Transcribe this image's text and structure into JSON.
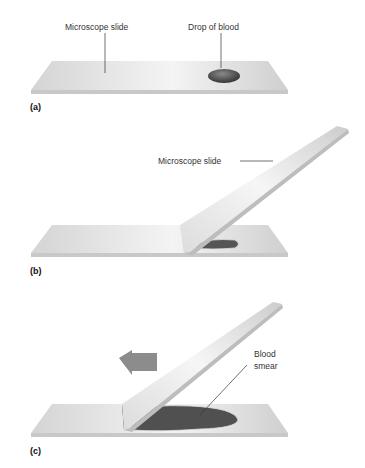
{
  "panels": [
    {
      "id": "a",
      "label": "(a)",
      "annotations": [
        "Microscope slide",
        "Drop of blood"
      ]
    },
    {
      "id": "b",
      "label": "(b)",
      "annotations": [
        "Microscope slide"
      ]
    },
    {
      "id": "c",
      "label": "(c)",
      "annotations": [
        "Blood",
        "smear"
      ]
    }
  ],
  "colors": {
    "slide": "#d9d9d9",
    "slide_edge": "#c8c8c8",
    "blood": "#4a4a4a",
    "arrow": "#8c8c8c"
  }
}
